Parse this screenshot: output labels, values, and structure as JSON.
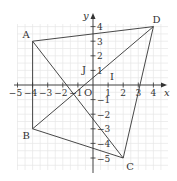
{
  "diagram": {
    "type": "coordinate-plane",
    "axes": {
      "x_label": "x",
      "y_label": "y",
      "origin_label": "O",
      "x_ticks": [
        -5,
        -4,
        -3,
        -2,
        -1,
        1,
        2,
        3,
        4
      ],
      "y_ticks": [
        4,
        3,
        2,
        1,
        -1,
        -2,
        -3,
        -4,
        -5
      ],
      "unit_vector_labels": {
        "i": "I",
        "j": "J"
      }
    },
    "points": [
      {
        "name": "A",
        "x": -4,
        "y": 3
      },
      {
        "name": "B",
        "x": -4,
        "y": -3
      },
      {
        "name": "C",
        "x": 2,
        "y": -5
      },
      {
        "name": "D",
        "x": 4,
        "y": 4
      }
    ],
    "segments": [
      [
        "A",
        "D"
      ],
      [
        "D",
        "C"
      ],
      [
        "C",
        "B"
      ],
      [
        "B",
        "A"
      ],
      [
        "A",
        "C"
      ],
      [
        "B",
        "D"
      ]
    ],
    "colors": {
      "lines": "#333333",
      "grid": "#e6e6e6"
    }
  }
}
